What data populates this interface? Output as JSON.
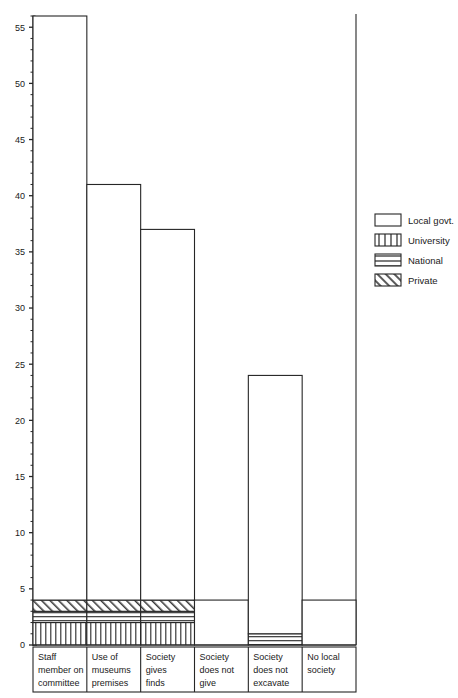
{
  "chart_data": {
    "type": "bar",
    "title": "",
    "subtitle": "",
    "xlabel": "",
    "ylabel": "",
    "ylim": [
      0,
      57
    ],
    "ytick_step": 5,
    "yminor_step": 1,
    "grid": false,
    "stacked": true,
    "legend_position": "right",
    "categories": [
      "Staff member on committee",
      "Use of museums premises",
      "Society gives finds",
      "Society does not give",
      "Society does not excavate",
      "No local society"
    ],
    "category_lines": [
      [
        "Staff",
        "member on",
        "committee"
      ],
      [
        "Use of",
        "museums",
        "premises"
      ],
      [
        "Society",
        "gives",
        "finds"
      ],
      [
        "Society",
        "does not",
        "give"
      ],
      [
        "Society",
        "does not",
        "excavate"
      ],
      [
        "No local",
        "society"
      ]
    ],
    "yticks": [
      0,
      5,
      10,
      15,
      20,
      25,
      30,
      35,
      40,
      45,
      50,
      55
    ],
    "series": [
      {
        "name": "University",
        "pattern": "vertical-stripes",
        "values": [
          2,
          2,
          2,
          0,
          0,
          0
        ]
      },
      {
        "name": "National",
        "pattern": "horizontal-stripes",
        "values": [
          1,
          1,
          1,
          0,
          1,
          0
        ]
      },
      {
        "name": "Private",
        "pattern": "diagonal-hatch",
        "values": [
          1,
          1,
          1,
          0,
          0,
          0
        ]
      },
      {
        "name": "Local govt.",
        "pattern": "solid-white",
        "values": [
          52,
          37,
          33,
          4,
          23,
          4
        ]
      }
    ],
    "totals": [
      56,
      41,
      37,
      4,
      24,
      4
    ],
    "legend": [
      {
        "label": "Local govt.",
        "pattern": "solid-white"
      },
      {
        "label": "University",
        "pattern": "vertical-stripes"
      },
      {
        "label": "National",
        "pattern": "horizontal-stripes"
      },
      {
        "label": "Private",
        "pattern": "diagonal-hatch"
      }
    ],
    "colors": {
      "line": "#262626",
      "fill": "#ffffff",
      "text": "#1a1a1a"
    }
  }
}
